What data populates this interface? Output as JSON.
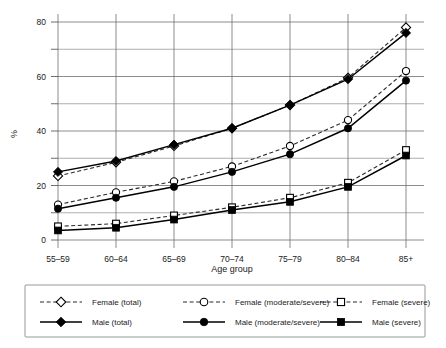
{
  "chart_data": {
    "type": "line",
    "title": "",
    "xlabel": "Age group",
    "ylabel": "%",
    "categories": [
      "55–59",
      "60–64",
      "65–69",
      "70–74",
      "75–79",
      "80–84",
      "85+"
    ],
    "ylim": [
      0,
      80
    ],
    "yticks": [
      0,
      20,
      40,
      60,
      80
    ],
    "yticklabels": [
      "0",
      "20",
      "40",
      "60",
      "80"
    ],
    "minor_gridlines": [
      10,
      30,
      50,
      70
    ],
    "grid": true,
    "legend_position": "bottom",
    "series": [
      {
        "name": "Female (total)",
        "values": [
          23.5,
          28.5,
          34.5,
          41,
          49.5,
          59.5,
          78
        ],
        "style": "dashed",
        "marker": "diamond-open"
      },
      {
        "name": "Female (moderate/severe)",
        "values": [
          13,
          17.5,
          21.5,
          27,
          34.5,
          44,
          62
        ],
        "style": "dashed",
        "marker": "circle-open"
      },
      {
        "name": "Female (severe)",
        "values": [
          5,
          6,
          9,
          12,
          15.5,
          21,
          33
        ],
        "style": "dashed",
        "marker": "square-open"
      },
      {
        "name": "Male (total)",
        "values": [
          25,
          29,
          35,
          41,
          49.5,
          59,
          76
        ],
        "style": "solid",
        "marker": "diamond-filled"
      },
      {
        "name": "Male (moderate/severe)",
        "values": [
          11.5,
          15.5,
          19.5,
          25,
          31.5,
          41,
          58.5
        ],
        "style": "solid",
        "marker": "circle-filled"
      },
      {
        "name": "Male (severe)",
        "values": [
          3.5,
          4.5,
          7.5,
          11,
          14,
          19.5,
          31
        ],
        "style": "solid",
        "marker": "square-filled"
      }
    ]
  },
  "legend": {
    "entries": [
      {
        "label": "Female (total)",
        "style": "dashed",
        "marker": "diamond-open"
      },
      {
        "label": "Female (moderate/severe)",
        "style": "dashed",
        "marker": "circle-open"
      },
      {
        "label": "Female (severe)",
        "style": "dashed",
        "marker": "square-open"
      },
      {
        "label": "Male (total)",
        "style": "solid",
        "marker": "diamond-filled"
      },
      {
        "label": "Male (moderate/severe)",
        "style": "solid",
        "marker": "circle-filled"
      },
      {
        "label": "Male (severe)",
        "style": "solid",
        "marker": "square-filled"
      }
    ]
  },
  "colors": {
    "line": "#000000",
    "grid": "#8d8d8d",
    "text": "#1a1a1a",
    "background": "#ffffff"
  }
}
